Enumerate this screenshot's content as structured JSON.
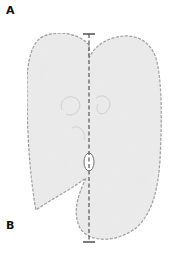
{
  "figure": {
    "panel_labels": [
      "A",
      "B"
    ],
    "colors": {
      "fill": "#e9e9e9",
      "outline": "#8a8a8a",
      "axis_line": "#555555",
      "background": "#ffffff",
      "label": "#111111"
    }
  }
}
